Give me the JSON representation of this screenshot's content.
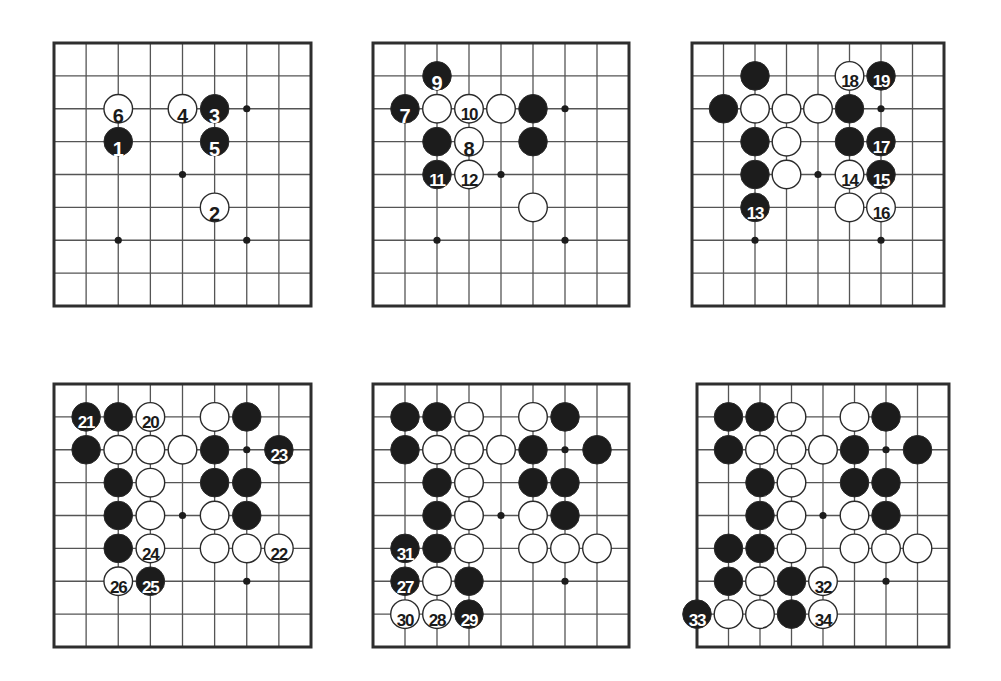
{
  "diagram": {
    "type": "go-game-sequence",
    "board_size": 9,
    "colors": {
      "black_stone": "#1c1c1c",
      "white_stone": "#ffffff",
      "stone_outline": "#2a2a2a",
      "line": "#555555",
      "border": "#2e2e2e",
      "background": "#ffffff",
      "star": "#1c1c1c"
    },
    "star_points": [
      [
        2,
        2
      ],
      [
        6,
        2
      ],
      [
        4,
        4
      ],
      [
        2,
        6
      ],
      [
        6,
        6
      ]
    ],
    "boards": [
      {
        "id": "board-1",
        "left": 54,
        "top": 43,
        "width": 257,
        "height": 263,
        "stones": [
          {
            "col": 2,
            "row": 2,
            "color": "white",
            "label": "6"
          },
          {
            "col": 4,
            "row": 2,
            "color": "white",
            "label": "4"
          },
          {
            "col": 5,
            "row": 2,
            "color": "black",
            "label": "3"
          },
          {
            "col": 2,
            "row": 3,
            "color": "black",
            "label": "1"
          },
          {
            "col": 5,
            "row": 3,
            "color": "black",
            "label": "5"
          },
          {
            "col": 5,
            "row": 5,
            "color": "white",
            "label": "2"
          }
        ]
      },
      {
        "id": "board-2",
        "left": 373,
        "top": 43,
        "width": 256,
        "height": 263,
        "stones": [
          {
            "col": 2,
            "row": 1,
            "color": "black",
            "label": "9"
          },
          {
            "col": 1,
            "row": 2,
            "color": "black",
            "label": "7"
          },
          {
            "col": 2,
            "row": 2,
            "color": "white",
            "label": ""
          },
          {
            "col": 3,
            "row": 2,
            "color": "white",
            "label": "10"
          },
          {
            "col": 4,
            "row": 2,
            "color": "white",
            "label": ""
          },
          {
            "col": 5,
            "row": 2,
            "color": "black",
            "label": ""
          },
          {
            "col": 2,
            "row": 3,
            "color": "black",
            "label": ""
          },
          {
            "col": 3,
            "row": 3,
            "color": "white",
            "label": "8"
          },
          {
            "col": 5,
            "row": 3,
            "color": "black",
            "label": ""
          },
          {
            "col": 2,
            "row": 4,
            "color": "black",
            "label": "11"
          },
          {
            "col": 3,
            "row": 4,
            "color": "white",
            "label": "12"
          },
          {
            "col": 5,
            "row": 5,
            "color": "white",
            "label": ""
          }
        ]
      },
      {
        "id": "board-3",
        "left": 692,
        "top": 43,
        "width": 252,
        "height": 263,
        "stones": [
          {
            "col": 2,
            "row": 1,
            "color": "black",
            "label": ""
          },
          {
            "col": 5,
            "row": 1,
            "color": "white",
            "label": "18"
          },
          {
            "col": 6,
            "row": 1,
            "color": "black",
            "label": "19"
          },
          {
            "col": 1,
            "row": 2,
            "color": "black",
            "label": ""
          },
          {
            "col": 2,
            "row": 2,
            "color": "white",
            "label": ""
          },
          {
            "col": 3,
            "row": 2,
            "color": "white",
            "label": ""
          },
          {
            "col": 4,
            "row": 2,
            "color": "white",
            "label": ""
          },
          {
            "col": 5,
            "row": 2,
            "color": "black",
            "label": ""
          },
          {
            "col": 2,
            "row": 3,
            "color": "black",
            "label": ""
          },
          {
            "col": 3,
            "row": 3,
            "color": "white",
            "label": ""
          },
          {
            "col": 5,
            "row": 3,
            "color": "black",
            "label": ""
          },
          {
            "col": 6,
            "row": 3,
            "color": "black",
            "label": "17"
          },
          {
            "col": 2,
            "row": 4,
            "color": "black",
            "label": ""
          },
          {
            "col": 3,
            "row": 4,
            "color": "white",
            "label": ""
          },
          {
            "col": 5,
            "row": 4,
            "color": "white",
            "label": "14"
          },
          {
            "col": 6,
            "row": 4,
            "color": "black",
            "label": "15"
          },
          {
            "col": 2,
            "row": 5,
            "color": "black",
            "label": "13"
          },
          {
            "col": 5,
            "row": 5,
            "color": "white",
            "label": ""
          },
          {
            "col": 6,
            "row": 5,
            "color": "white",
            "label": "16"
          }
        ]
      },
      {
        "id": "board-4",
        "left": 54,
        "top": 384,
        "width": 257,
        "height": 263,
        "stones": [
          {
            "col": 1,
            "row": 1,
            "color": "black",
            "label": "21"
          },
          {
            "col": 2,
            "row": 1,
            "color": "black",
            "label": ""
          },
          {
            "col": 3,
            "row": 1,
            "color": "white",
            "label": "20"
          },
          {
            "col": 5,
            "row": 1,
            "color": "white",
            "label": ""
          },
          {
            "col": 6,
            "row": 1,
            "color": "black",
            "label": ""
          },
          {
            "col": 1,
            "row": 2,
            "color": "black",
            "label": ""
          },
          {
            "col": 2,
            "row": 2,
            "color": "white",
            "label": ""
          },
          {
            "col": 3,
            "row": 2,
            "color": "white",
            "label": ""
          },
          {
            "col": 4,
            "row": 2,
            "color": "white",
            "label": ""
          },
          {
            "col": 5,
            "row": 2,
            "color": "black",
            "label": ""
          },
          {
            "col": 7,
            "row": 2,
            "color": "black",
            "label": "23"
          },
          {
            "col": 2,
            "row": 3,
            "color": "black",
            "label": ""
          },
          {
            "col": 3,
            "row": 3,
            "color": "white",
            "label": ""
          },
          {
            "col": 5,
            "row": 3,
            "color": "black",
            "label": ""
          },
          {
            "col": 6,
            "row": 3,
            "color": "black",
            "label": ""
          },
          {
            "col": 2,
            "row": 4,
            "color": "black",
            "label": ""
          },
          {
            "col": 3,
            "row": 4,
            "color": "white",
            "label": ""
          },
          {
            "col": 5,
            "row": 4,
            "color": "white",
            "label": ""
          },
          {
            "col": 6,
            "row": 4,
            "color": "black",
            "label": ""
          },
          {
            "col": 2,
            "row": 5,
            "color": "black",
            "label": ""
          },
          {
            "col": 3,
            "row": 5,
            "color": "white",
            "label": "24"
          },
          {
            "col": 5,
            "row": 5,
            "color": "white",
            "label": ""
          },
          {
            "col": 6,
            "row": 5,
            "color": "white",
            "label": ""
          },
          {
            "col": 7,
            "row": 5,
            "color": "white",
            "label": "22"
          },
          {
            "col": 2,
            "row": 6,
            "color": "white",
            "label": "26"
          },
          {
            "col": 3,
            "row": 6,
            "color": "black",
            "label": "25"
          }
        ]
      },
      {
        "id": "board-5",
        "left": 373,
        "top": 384,
        "width": 256,
        "height": 263,
        "stones": [
          {
            "col": 1,
            "row": 1,
            "color": "black",
            "label": ""
          },
          {
            "col": 2,
            "row": 1,
            "color": "black",
            "label": ""
          },
          {
            "col": 3,
            "row": 1,
            "color": "white",
            "label": ""
          },
          {
            "col": 5,
            "row": 1,
            "color": "white",
            "label": ""
          },
          {
            "col": 6,
            "row": 1,
            "color": "black",
            "label": ""
          },
          {
            "col": 1,
            "row": 2,
            "color": "black",
            "label": ""
          },
          {
            "col": 2,
            "row": 2,
            "color": "white",
            "label": ""
          },
          {
            "col": 3,
            "row": 2,
            "color": "white",
            "label": ""
          },
          {
            "col": 4,
            "row": 2,
            "color": "white",
            "label": ""
          },
          {
            "col": 5,
            "row": 2,
            "color": "black",
            "label": ""
          },
          {
            "col": 7,
            "row": 2,
            "color": "black",
            "label": ""
          },
          {
            "col": 2,
            "row": 3,
            "color": "black",
            "label": ""
          },
          {
            "col": 3,
            "row": 3,
            "color": "white",
            "label": ""
          },
          {
            "col": 5,
            "row": 3,
            "color": "black",
            "label": ""
          },
          {
            "col": 6,
            "row": 3,
            "color": "black",
            "label": ""
          },
          {
            "col": 2,
            "row": 4,
            "color": "black",
            "label": ""
          },
          {
            "col": 3,
            "row": 4,
            "color": "white",
            "label": ""
          },
          {
            "col": 5,
            "row": 4,
            "color": "white",
            "label": ""
          },
          {
            "col": 6,
            "row": 4,
            "color": "black",
            "label": ""
          },
          {
            "col": 1,
            "row": 5,
            "color": "black",
            "label": "31"
          },
          {
            "col": 2,
            "row": 5,
            "color": "black",
            "label": ""
          },
          {
            "col": 3,
            "row": 5,
            "color": "white",
            "label": ""
          },
          {
            "col": 5,
            "row": 5,
            "color": "white",
            "label": ""
          },
          {
            "col": 6,
            "row": 5,
            "color": "white",
            "label": ""
          },
          {
            "col": 7,
            "row": 5,
            "color": "white",
            "label": ""
          },
          {
            "col": 1,
            "row": 6,
            "color": "black",
            "label": "27"
          },
          {
            "col": 2,
            "row": 6,
            "color": "white",
            "label": ""
          },
          {
            "col": 3,
            "row": 6,
            "color": "black",
            "label": ""
          },
          {
            "col": 1,
            "row": 7,
            "color": "white",
            "label": "30"
          },
          {
            "col": 2,
            "row": 7,
            "color": "white",
            "label": "28"
          },
          {
            "col": 3,
            "row": 7,
            "color": "black",
            "label": "29"
          }
        ]
      },
      {
        "id": "board-6",
        "left": 697,
        "top": 384,
        "width": 252,
        "height": 263,
        "stones": [
          {
            "col": 1,
            "row": 1,
            "color": "black",
            "label": ""
          },
          {
            "col": 2,
            "row": 1,
            "color": "black",
            "label": ""
          },
          {
            "col": 3,
            "row": 1,
            "color": "white",
            "label": ""
          },
          {
            "col": 5,
            "row": 1,
            "color": "white",
            "label": ""
          },
          {
            "col": 6,
            "row": 1,
            "color": "black",
            "label": ""
          },
          {
            "col": 1,
            "row": 2,
            "color": "black",
            "label": ""
          },
          {
            "col": 2,
            "row": 2,
            "color": "white",
            "label": ""
          },
          {
            "col": 3,
            "row": 2,
            "color": "white",
            "label": ""
          },
          {
            "col": 4,
            "row": 2,
            "color": "white",
            "label": ""
          },
          {
            "col": 5,
            "row": 2,
            "color": "black",
            "label": ""
          },
          {
            "col": 7,
            "row": 2,
            "color": "black",
            "label": ""
          },
          {
            "col": 2,
            "row": 3,
            "color": "black",
            "label": ""
          },
          {
            "col": 3,
            "row": 3,
            "color": "white",
            "label": ""
          },
          {
            "col": 5,
            "row": 3,
            "color": "black",
            "label": ""
          },
          {
            "col": 6,
            "row": 3,
            "color": "black",
            "label": ""
          },
          {
            "col": 2,
            "row": 4,
            "color": "black",
            "label": ""
          },
          {
            "col": 3,
            "row": 4,
            "color": "white",
            "label": ""
          },
          {
            "col": 5,
            "row": 4,
            "color": "white",
            "label": ""
          },
          {
            "col": 6,
            "row": 4,
            "color": "black",
            "label": ""
          },
          {
            "col": 1,
            "row": 5,
            "color": "black",
            "label": ""
          },
          {
            "col": 2,
            "row": 5,
            "color": "black",
            "label": ""
          },
          {
            "col": 3,
            "row": 5,
            "color": "white",
            "label": ""
          },
          {
            "col": 5,
            "row": 5,
            "color": "white",
            "label": ""
          },
          {
            "col": 6,
            "row": 5,
            "color": "white",
            "label": ""
          },
          {
            "col": 7,
            "row": 5,
            "color": "white",
            "label": ""
          },
          {
            "col": 1,
            "row": 6,
            "color": "black",
            "label": ""
          },
          {
            "col": 2,
            "row": 6,
            "color": "white",
            "label": ""
          },
          {
            "col": 3,
            "row": 6,
            "color": "black",
            "label": ""
          },
          {
            "col": 4,
            "row": 6,
            "color": "white",
            "label": "32"
          },
          {
            "col": 0,
            "row": 7,
            "color": "black",
            "label": "33"
          },
          {
            "col": 1,
            "row": 7,
            "color": "white",
            "label": ""
          },
          {
            "col": 2,
            "row": 7,
            "color": "white",
            "label": ""
          },
          {
            "col": 3,
            "row": 7,
            "color": "black",
            "label": ""
          },
          {
            "col": 4,
            "row": 7,
            "color": "white",
            "label": "34"
          }
        ]
      }
    ]
  }
}
